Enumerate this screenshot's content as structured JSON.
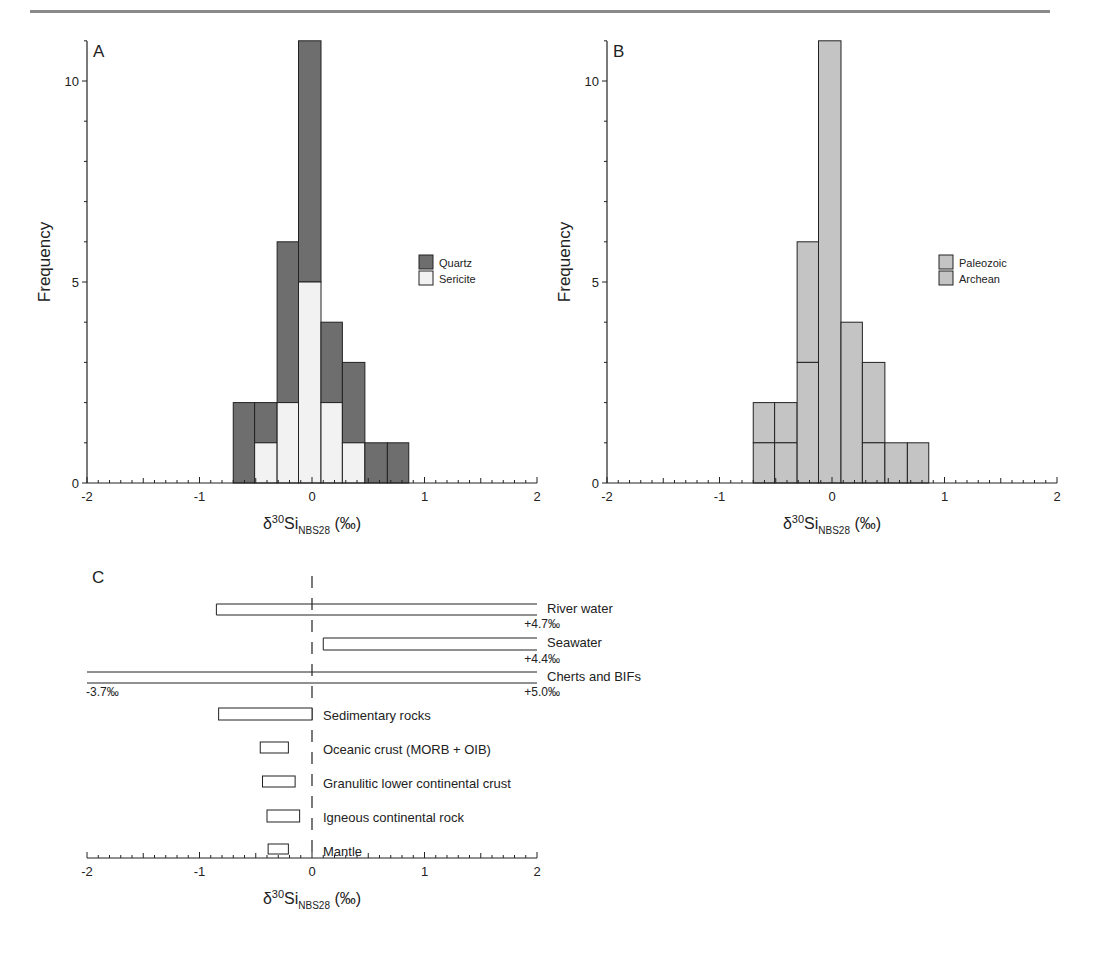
{
  "header": {
    "rule_color": "#8a8a8a"
  },
  "colors": {
    "quartz": "#6e6e6e",
    "sericite": "#f2f2f2",
    "paleozoic": "#c4c4c4",
    "archean": "#c4c4c4",
    "axis": "#222222"
  },
  "chart_data": [
    {
      "panel": "A",
      "type": "bar",
      "stacked": true,
      "title": "",
      "panel_label": "A",
      "xlabel": "δ30Si NBS28 (‰)",
      "ylabel": "Frequency",
      "xlim": [
        -2,
        2
      ],
      "ylim": [
        0,
        11
      ],
      "xticks": [
        "-2",
        "-1",
        "0",
        "1",
        "2"
      ],
      "yticks": [
        "0",
        "5",
        "10"
      ],
      "bin_edges": [
        -0.7,
        -0.51,
        -0.31,
        -0.12,
        0.08,
        0.27,
        0.47,
        0.67,
        0.86
      ],
      "legend": {
        "position": "right",
        "entries": [
          "Quartz",
          "Sericite"
        ]
      },
      "series": [
        {
          "name": "Sericite",
          "values": [
            0,
            1,
            2,
            5,
            2,
            1,
            0,
            0
          ]
        },
        {
          "name": "Quartz",
          "values": [
            2,
            1,
            4,
            6,
            2,
            2,
            1,
            1
          ]
        }
      ],
      "totals": [
        2,
        2,
        6,
        11,
        4,
        3,
        1,
        1
      ]
    },
    {
      "panel": "B",
      "type": "bar",
      "stacked": true,
      "title": "",
      "panel_label": "B",
      "xlabel": "δ30Si NBS28 (‰)",
      "ylabel": "Frequency",
      "xlim": [
        -2,
        2
      ],
      "ylim": [
        0,
        11
      ],
      "xticks": [
        "-2",
        "-1",
        "0",
        "1",
        "2"
      ],
      "yticks": [
        "0",
        "5",
        "10"
      ],
      "bin_edges": [
        -0.7,
        -0.51,
        -0.31,
        -0.12,
        0.08,
        0.27,
        0.47,
        0.67,
        0.86
      ],
      "legend": {
        "position": "right",
        "entries": [
          "Paleozoic",
          "Archean"
        ]
      },
      "series": [
        {
          "name": "Archean",
          "values": [
            1,
            1,
            3,
            11,
            4,
            1,
            1,
            1
          ]
        },
        {
          "name": "Paleozoic",
          "values": [
            1,
            1,
            3,
            0,
            0,
            2,
            0,
            0
          ]
        }
      ],
      "totals": [
        2,
        2,
        6,
        11,
        4,
        3,
        1,
        1
      ]
    },
    {
      "panel": "C",
      "type": "range",
      "panel_label": "C",
      "xlabel": "δ30Si NBS28 (‰)",
      "xlim": [
        -2,
        2
      ],
      "xticks": [
        "-2",
        "-1",
        "0",
        "1",
        "2"
      ],
      "reference_line": 0,
      "ranges": [
        {
          "label": "River water",
          "min": -0.85,
          "max": 4.7,
          "max_label": "+4.7‰"
        },
        {
          "label": "Seawater",
          "min": 0.1,
          "max": 4.4,
          "max_label": "+4.4‰"
        },
        {
          "label": "Cherts and BIFs",
          "min": -3.7,
          "max": 5.0,
          "min_label": "-3.7‰",
          "max_label": "+5.0‰"
        },
        {
          "label": "Sedimentary rocks",
          "min": -0.83,
          "max": 0.0
        },
        {
          "label": "Oceanic crust (MORB + OIB)",
          "min": -0.46,
          "max": -0.21
        },
        {
          "label": "Granulitic lower continental crust",
          "min": -0.44,
          "max": -0.15
        },
        {
          "label": "Igneous continental rock",
          "min": -0.4,
          "max": -0.11
        },
        {
          "label": "Mantle",
          "min": -0.39,
          "max": -0.21
        }
      ]
    }
  ],
  "axis_label": {
    "delta": "δ",
    "sup": "30",
    "element": "Si",
    "sub": "NBS28",
    "unit": "(‰)"
  }
}
